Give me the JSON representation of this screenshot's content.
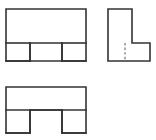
{
  "drawing": {
    "title": "Orthographic Projection - Three Views",
    "description": "Engineering multiview drawing of a block with two rectangular notches",
    "sheet": {
      "width": 156,
      "height": 140,
      "background": "#ffffff"
    },
    "line_styles": {
      "visible_edge_color": "#333333",
      "visible_edge_width": 1.6,
      "hidden_edge_color": "#666666",
      "hidden_edge_width": 1.1,
      "hidden_edge_dash": "2.4 2.2"
    },
    "views": [
      {
        "id": "top-view",
        "name": "Top View",
        "position": "upper-left",
        "shape": "rectangle-with-two-bottom-notches",
        "bounds": {
          "x": 6,
          "y": 9,
          "width": 80,
          "height": 52
        },
        "outline_points": "6,9 86,9 86,61 62,61 62,43 30,43 30,61 6,61 6,9",
        "notches": [
          {
            "id": "left-notch",
            "x": 6,
            "y": 43,
            "width": 24,
            "height": 18
          },
          {
            "id": "right-notch",
            "x": 62,
            "y": 43,
            "width": 24,
            "height": 18
          }
        ]
      },
      {
        "id": "right-side-view",
        "name": "Right Side View",
        "position": "upper-right",
        "shape": "L-shape",
        "bounds": {
          "x": 108,
          "y": 9,
          "width": 42,
          "height": 52
        },
        "outline_points": "108,9 132,9 132,43 150,43 150,61 108,61 108,9",
        "hidden_lines": [
          {
            "id": "hidden-vertical-line",
            "x1": 125,
            "y1": 43,
            "x2": 125,
            "y2": 61
          }
        ]
      },
      {
        "id": "front-view",
        "name": "Front View",
        "position": "lower-left",
        "shape": "U-shape",
        "bounds": {
          "x": 6,
          "y": 87,
          "width": 80,
          "height": 46
        },
        "outline_points": "6,87 86,87 86,133 62,133 62,110 30,110 30,133 6,133 6,87",
        "internal_lines": [
          {
            "id": "web-divider-line",
            "x1": 6,
            "y1": 110,
            "x2": 86,
            "y2": 110
          }
        ],
        "legs": [
          {
            "id": "left-leg",
            "x": 6,
            "y": 110,
            "width": 24,
            "height": 23
          },
          {
            "id": "right-leg",
            "x": 62,
            "y": 110,
            "width": 24,
            "height": 23
          }
        ]
      }
    ]
  }
}
